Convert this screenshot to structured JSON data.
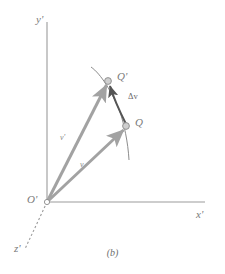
{
  "figure": {
    "caption": "(b)",
    "axes": {
      "x_label": "x'",
      "y_label": "y'",
      "z_label": "z'",
      "origin_label": "O'"
    },
    "points": [
      {
        "id": "q-prime",
        "label": "Q'",
        "x": 108,
        "y": 81
      },
      {
        "id": "q",
        "label": "Q",
        "x": 126,
        "y": 126
      }
    ],
    "vectors": [
      {
        "id": "v-prime",
        "label": "v'",
        "from": "O'",
        "to": "Q'",
        "color": "#9a9a9a"
      },
      {
        "id": "v",
        "label": "v",
        "from": "O'",
        "to": "Q",
        "color": "#9a9a9a"
      },
      {
        "id": "delta-v",
        "label": "Δv",
        "from": "Q",
        "to": "Q'",
        "color": "#555555"
      }
    ],
    "curve": {
      "id": "trajectory",
      "description": "path through Q and Q'",
      "color": "#888888"
    },
    "colors": {
      "axis": "#9b9b9b",
      "vector": "#a2a2a2",
      "delta": "#5a5a5a",
      "curve": "#8c8c8c",
      "marker_fill": "#cfcfcf",
      "marker_stroke": "#8a8a8a",
      "text": "#6e6e6e",
      "background": "#ffffff"
    }
  }
}
